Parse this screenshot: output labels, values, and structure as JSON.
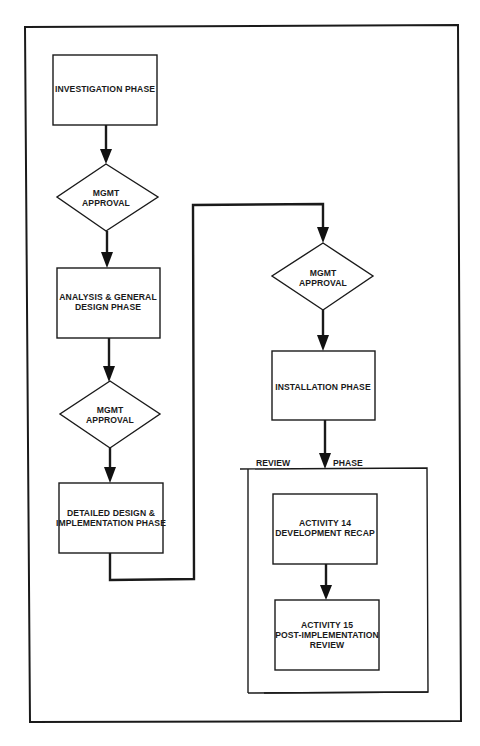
{
  "diagram": {
    "type": "flowchart",
    "colors": {
      "line": "#1a1a1a",
      "background": "#ffffff"
    },
    "nodes": [
      {
        "id": "investigation",
        "shape": "rect",
        "lines": [
          "INVESTIGATION PHASE"
        ]
      },
      {
        "id": "approval1",
        "shape": "diamond",
        "lines": [
          "MGMT",
          "APPROVAL"
        ]
      },
      {
        "id": "analysis",
        "shape": "rect",
        "lines": [
          "ANALYSIS & GENERAL",
          "DESIGN PHASE"
        ]
      },
      {
        "id": "approval2",
        "shape": "diamond",
        "lines": [
          "MGMT",
          "APPROVAL"
        ]
      },
      {
        "id": "detailed",
        "shape": "rect",
        "lines": [
          "DETAILED DESIGN &",
          "IMPLEMENTATION PHASE"
        ]
      },
      {
        "id": "approval3",
        "shape": "diamond",
        "lines": [
          "MGMT",
          "APPROVAL"
        ]
      },
      {
        "id": "installation",
        "shape": "rect",
        "lines": [
          "INSTALLATION PHASE"
        ]
      },
      {
        "id": "activity14",
        "shape": "rect",
        "lines": [
          "ACTIVITY 14",
          "DEVELOPMENT RECAP"
        ]
      },
      {
        "id": "activity15",
        "shape": "rect",
        "lines": [
          "ACTIVITY 15",
          "POST-IMPLEMENTATION",
          "REVIEW"
        ]
      }
    ],
    "groups": [
      {
        "id": "review-phase",
        "label_left": "REVIEW",
        "label_right": "PHASE",
        "contains": [
          "activity14",
          "activity15"
        ]
      }
    ],
    "edges": [
      {
        "from": "investigation",
        "to": "approval1"
      },
      {
        "from": "approval1",
        "to": "analysis"
      },
      {
        "from": "analysis",
        "to": "approval2"
      },
      {
        "from": "approval2",
        "to": "detailed"
      },
      {
        "from": "detailed",
        "to": "approval3"
      },
      {
        "from": "approval3",
        "to": "installation"
      },
      {
        "from": "installation",
        "to": "review-phase"
      },
      {
        "from": "activity14",
        "to": "activity15"
      }
    ]
  }
}
